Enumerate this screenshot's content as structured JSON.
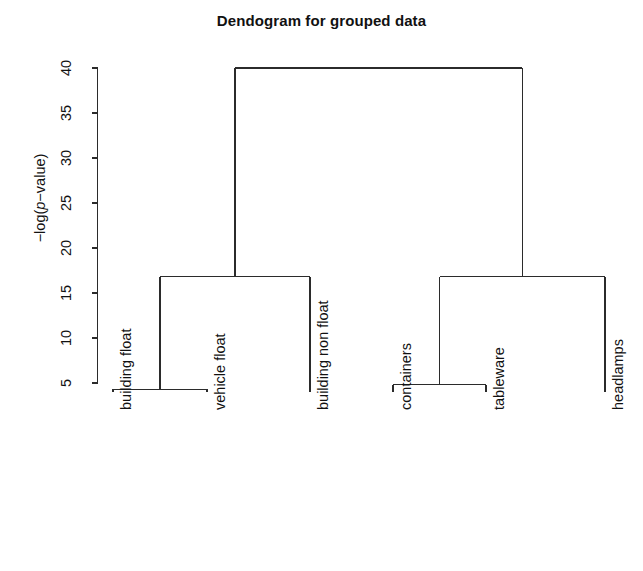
{
  "title": "Dendogram for grouped data",
  "axis": {
    "ylabel_prefix": "−log(",
    "ylabel_italic": "p",
    "ylabel_suffix": "−value)",
    "ylabel_full": "−log(p−value)",
    "ticks": [
      "5",
      "10",
      "15",
      "20",
      "25",
      "30",
      "35",
      "40"
    ]
  },
  "leaves": [
    {
      "label": "building float"
    },
    {
      "label": "vehicle float"
    },
    {
      "label": "building non float"
    },
    {
      "label": "containers"
    },
    {
      "label": "tableware"
    },
    {
      "label": "headlamps"
    }
  ],
  "colors": {
    "line": "#2b2b2b",
    "text": "#111111",
    "background": "#ffffff"
  },
  "chart_data": {
    "type": "dendrogram",
    "title": "Dendogram for grouped data",
    "xlabel": "",
    "ylabel": "−log(p−value)",
    "ylim": [
      4,
      40
    ],
    "yticks": [
      5,
      10,
      15,
      20,
      25,
      30,
      35,
      40
    ],
    "grid": false,
    "legend": "none",
    "labels": [
      "building float",
      "vehicle float",
      "building non float",
      "containers",
      "tableware",
      "headlamps"
    ],
    "leaf_order": [
      "building float",
      "vehicle float",
      "building non float",
      "containers",
      "tableware",
      "headlamps"
    ],
    "leaf_base_height": 4.0,
    "merges": [
      {
        "id": "m1",
        "children": [
          "building float",
          "vehicle float"
        ],
        "height": 4.3
      },
      {
        "id": "m2",
        "children": [
          "containers",
          "tableware"
        ],
        "height": 4.8
      },
      {
        "id": "m3",
        "children": [
          "m1",
          "building non float"
        ],
        "height": 16.8
      },
      {
        "id": "m4",
        "children": [
          "m2",
          "headlamps"
        ],
        "height": 16.8
      },
      {
        "id": "m5",
        "children": [
          "m3",
          "m4"
        ],
        "height": 40.0
      }
    ]
  }
}
